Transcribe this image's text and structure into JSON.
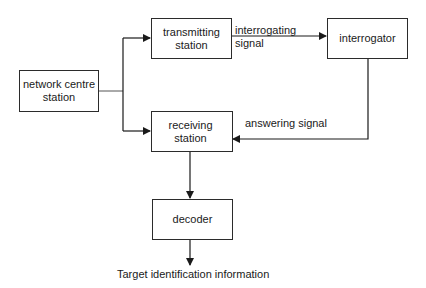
{
  "diagram": {
    "nodes": {
      "network_centre": {
        "line1": "network centre",
        "line2": "station"
      },
      "transmitting": {
        "line1": "transmitting",
        "line2": "station"
      },
      "interrogator": {
        "label": "interrogator"
      },
      "receiving": {
        "label": "receiving station"
      },
      "decoder": {
        "label": "decoder"
      }
    },
    "edges": {
      "interrogating": {
        "line1": "interrogating",
        "line2": "signal"
      },
      "answering": {
        "label": "answering signal"
      },
      "output": {
        "label": "Target identification information"
      }
    },
    "colors": {
      "stroke": "#1a1a1a",
      "background": "#ffffff"
    }
  }
}
